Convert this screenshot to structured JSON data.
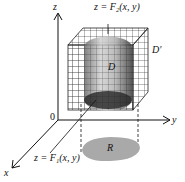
{
  "figure": {
    "labels": {
      "top_surface": "z = F₂(x, y)",
      "bottom_surface": "z = F₁(x, y)",
      "region_solid": "D",
      "box": "D′",
      "projection": "R",
      "origin": "0",
      "x_axis": "x",
      "y_axis": "y",
      "z_axis": "z"
    },
    "colors": {
      "grid": "#222222",
      "solid_dark": "#3a3a3a",
      "solid_light": "#d8d8d8",
      "region_fill": "#a9a9a9",
      "axis": "#111111"
    }
  }
}
